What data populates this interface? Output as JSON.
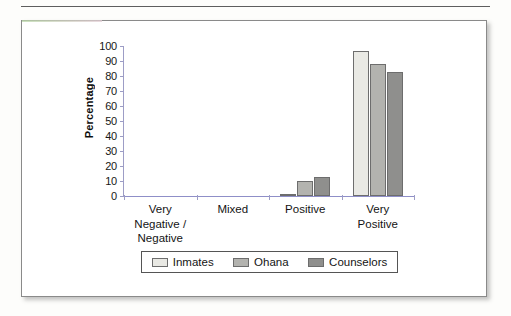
{
  "figure": {
    "frame_border_color": "#8a8a8a",
    "background_color": "#ffffff"
  },
  "chart_data": {
    "type": "bar",
    "title": "",
    "xlabel": "",
    "ylabel": "Percentage",
    "ylim": [
      0,
      100
    ],
    "ytick_step": 10,
    "yticks": [
      100,
      90,
      80,
      70,
      60,
      50,
      40,
      30,
      20,
      10,
      0
    ],
    "grid": false,
    "legend_position": "bottom",
    "categories": [
      "Very\nNegative /\nNegative",
      "Mixed",
      "Positive",
      "Very\nPositive"
    ],
    "category_labels": [
      {
        "line1": "Very",
        "line2": "Negative /",
        "line3": "Negative"
      },
      {
        "line1": "Mixed",
        "line2": "",
        "line3": ""
      },
      {
        "line1": "Positive",
        "line2": "",
        "line3": ""
      },
      {
        "line1": "Very",
        "line2": "Positive",
        "line3": ""
      }
    ],
    "series": [
      {
        "name": "Inmates",
        "color": "#e9e9e4",
        "values": [
          0,
          0,
          1,
          97
        ]
      },
      {
        "name": "Ohana",
        "color": "#b3b3af",
        "values": [
          0,
          0,
          10,
          88
        ]
      },
      {
        "name": "Counselors",
        "color": "#8f8f8d",
        "values": [
          0,
          0,
          13,
          83
        ]
      }
    ]
  },
  "legend": {
    "items": [
      {
        "label": "Inmates",
        "color": "#e9e9e4"
      },
      {
        "label": "Ohana",
        "color": "#b3b3af"
      },
      {
        "label": "Counselors",
        "color": "#8f8f8d"
      }
    ]
  }
}
